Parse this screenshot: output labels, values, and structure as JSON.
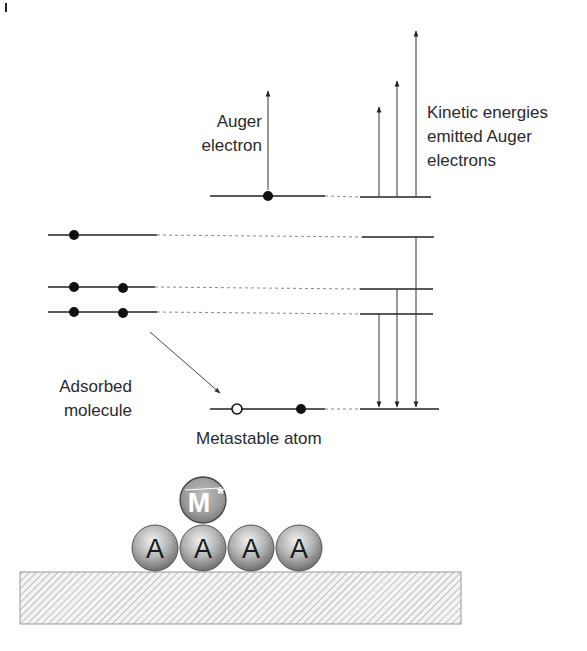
{
  "diagram": {
    "type": "energy-level diagram (Penning ionization / metastable de-excitation)",
    "labels": {
      "auger_line1": "Auger",
      "auger_line2": "electron",
      "kinetic_line1": "Kinetic energies",
      "kinetic_line2": "emitted Auger",
      "kinetic_line3": "electrons",
      "adsorbed_line1": "Adsorbed",
      "adsorbed_line2": "molecule",
      "metastable": "Metastable atom"
    },
    "surface": {
      "metastable_symbol": "M",
      "metastable_superscript": "*",
      "adsorbate_symbol": "A",
      "adsorbate_count": 4
    },
    "energy_levels": {
      "molecule_levels": [
        {
          "name": "level-1",
          "electrons": 1
        },
        {
          "name": "level-2",
          "electrons": 2
        },
        {
          "name": "level-3",
          "electrons": 2
        }
      ],
      "metastable_levels": [
        {
          "name": "excited-level",
          "electrons": 1
        },
        {
          "name": "ground-level",
          "electrons": 1,
          "holes": 1
        }
      ],
      "transitions_down": 3,
      "auger_arrows_up": 3
    },
    "colors": {
      "line": "#222222",
      "dashed": "#888888",
      "sphere_A": "#9a9a9a",
      "sphere_M": "#8c8c8c",
      "hatch": "#b0b0b0"
    }
  }
}
